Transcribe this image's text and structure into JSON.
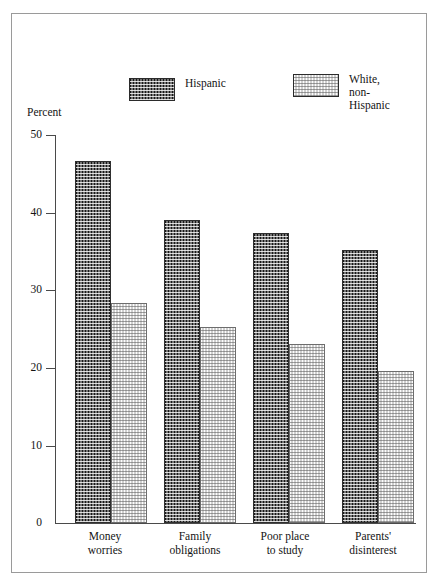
{
  "chart_data": {
    "type": "bar",
    "title": "",
    "xlabel": "",
    "ylabel": "Percent",
    "ylim": [
      0,
      50
    ],
    "yticks": [
      0,
      10,
      20,
      30,
      40,
      50
    ],
    "grid": false,
    "legend_position": "top",
    "categories": [
      "Money\nworries",
      "Family\nobligations",
      "Poor place\nto study",
      "Parents'\ndisinterest"
    ],
    "series": [
      {
        "name": "Hispanic",
        "values": [
          46.6,
          39.0,
          37.4,
          35.2
        ],
        "swatch": "dark-dotted",
        "color": "#171717"
      },
      {
        "name": "White,\nnon-Hispanic",
        "values": [
          28.4,
          25.3,
          23.1,
          19.6
        ],
        "swatch": "light-dotted",
        "color": "#fdfdfd"
      }
    ]
  },
  "legend": {
    "entries": [
      {
        "label": "Hispanic"
      },
      {
        "label": "White,\nnon-Hispanic"
      }
    ]
  },
  "axis": {
    "percent_label": "Percent",
    "tick_labels": [
      "50",
      "40",
      "30",
      "20",
      "10",
      "0"
    ]
  }
}
